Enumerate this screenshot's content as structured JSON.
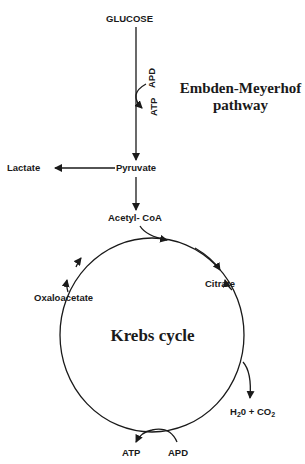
{
  "diagram": {
    "stroke_color": "#1a1a1a",
    "nodes": {
      "glucose": "GLUCOSE",
      "pyruvate": "Pyruvate",
      "lactate": "Lactate",
      "acetyl_coa": "Acetyl- CoA",
      "citrate": "Citrate",
      "oxaloacetate": "Oxaloacetate",
      "products": {
        "h2o": "H",
        "h2o_sub": "2",
        "h2o_rest": "0 + CO",
        "co2_sub": "2"
      }
    },
    "labels": {
      "pathway": "Embden-Meyerhof",
      "pathway_line2": "pathway",
      "cycle": "Krebs cycle",
      "glycolysis_in": "APD",
      "glycolysis_out": "ATP",
      "cycle_in": "APD",
      "cycle_out": "ATP"
    },
    "edges": [
      {
        "from": "GLUCOSE",
        "to": "Pyruvate"
      },
      {
        "from": "Pyruvate",
        "to": "Lactate"
      },
      {
        "from": "Pyruvate",
        "to": "Acetyl- CoA"
      },
      {
        "from": "Acetyl- CoA",
        "to": "Krebs cycle"
      },
      {
        "from": "Krebs cycle",
        "to": "Citrate"
      },
      {
        "from": "Citrate",
        "to": "H2O + CO2"
      },
      {
        "from": "Oxaloacetate",
        "to": "Krebs cycle"
      },
      {
        "from": "APD",
        "to": "ATP"
      }
    ]
  }
}
